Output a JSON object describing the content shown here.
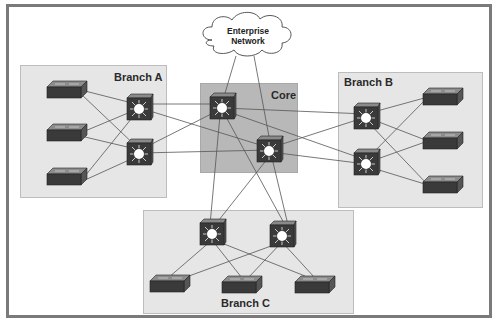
{
  "cloud": {
    "line1": "Enterprise",
    "line2": "Network"
  },
  "zones": {
    "branch_a": {
      "label": "Branch  A"
    },
    "core": {
      "label": "Core"
    },
    "branch_b": {
      "label": "Branch B"
    },
    "branch_c": {
      "label": "Branch C"
    }
  },
  "colors": {
    "frame": "#7a7a7a",
    "zone_fill": "#e6e6e6",
    "core_fill": "#b8b8b8",
    "device_body": "#3a3a3a",
    "link": "#555555"
  }
}
